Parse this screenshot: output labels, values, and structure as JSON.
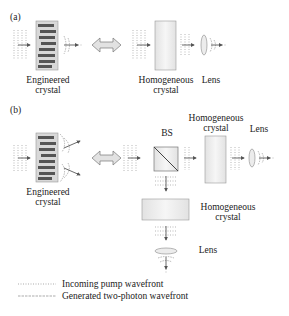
{
  "panels": {
    "a": {
      "label": "(a)",
      "engineered_crystal_label_1": "Engineered",
      "engineered_crystal_label_2": "crystal",
      "homogeneous_crystal_label_1": "Homogeneous",
      "homogeneous_crystal_label_2": "crystal",
      "lens_label": "Lens"
    },
    "b": {
      "label": "(b)",
      "engineered_crystal_label_1": "Engineered",
      "engineered_crystal_label_2": "crystal",
      "bs_label": "BS",
      "homogeneous_crystal_top_label_1": "Homogeneous",
      "homogeneous_crystal_top_label_2": "crystal",
      "lens_top_label": "Lens",
      "homogeneous_crystal_bottom_label_1": "Homogeneous",
      "homogeneous_crystal_bottom_label_2": "crystal",
      "lens_bottom_label": "Lens"
    }
  },
  "legend": {
    "items": [
      {
        "label": "Incoming pump wavefront",
        "style": "dotted"
      },
      {
        "label": "Generated two-photon wavefront",
        "style": "dashed"
      }
    ]
  },
  "colors": {
    "crystal_fill": "#e6e6e6",
    "crystal_stroke": "#9a9a9a",
    "engineered_dots": "#555555",
    "arrow_fill": "#dddddd",
    "line": "#555555"
  }
}
